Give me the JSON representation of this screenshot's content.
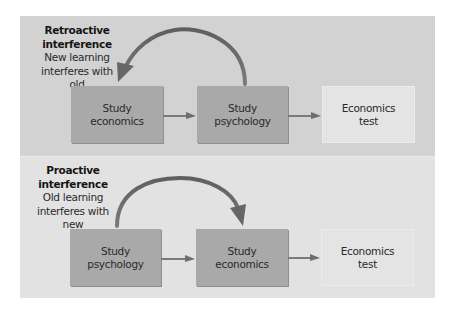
{
  "diagram": {
    "retroactive": {
      "title_line1": "Retroactive",
      "title_line2": "interference",
      "desc_line1": "New learning",
      "desc_line2": "interferes with old",
      "steps": [
        {
          "label": "Study\neconomics",
          "style": "dark"
        },
        {
          "label": "Study\npsychology",
          "style": "dark"
        },
        {
          "label": "Economics\ntest",
          "style": "light"
        }
      ],
      "curved_arrow": {
        "from": "Study psychology",
        "to": "Study economics",
        "direction": "backward"
      }
    },
    "proactive": {
      "title_line1": "Proactive",
      "title_line2": "interference",
      "desc_line1": "Old learning",
      "desc_line2": "interferes with new",
      "steps": [
        {
          "label": "Study\npsychology",
          "style": "dark"
        },
        {
          "label": "Study\neconomics",
          "style": "dark"
        },
        {
          "label": "Economics\ntest",
          "style": "light"
        }
      ],
      "curved_arrow": {
        "from": "Study psychology",
        "to": "Study economics",
        "direction": "forward"
      }
    },
    "colors": {
      "panel_top": "#d2d2d2",
      "panel_bottom": "#e2e2e2",
      "box_dark": "#a9a9a9",
      "box_light": "#e4e4e4",
      "arrow": "#6e6e6e"
    }
  }
}
